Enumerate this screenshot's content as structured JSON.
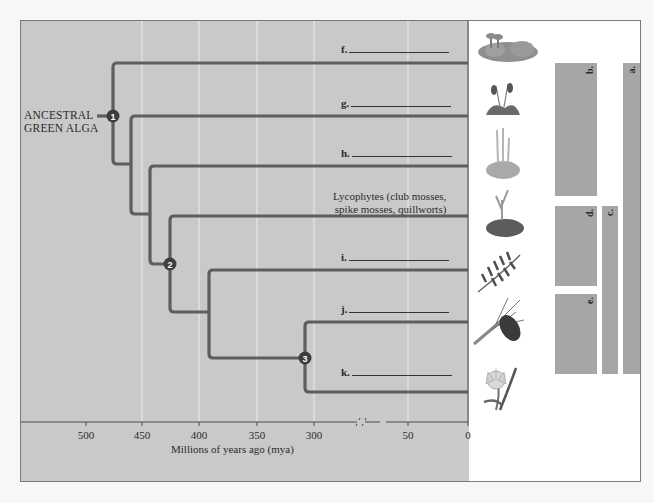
{
  "diagram": {
    "type": "phylogenetic_tree",
    "root_label": [
      "ANCESTRAL",
      "GREEN ALGA"
    ],
    "nodes": [
      {
        "id": "1",
        "label": "1"
      },
      {
        "id": "2",
        "label": "2"
      },
      {
        "id": "3",
        "label": "3"
      }
    ],
    "branches": [
      {
        "label": "f.",
        "blank": true
      },
      {
        "label": "g.",
        "blank": true
      },
      {
        "label": "h.",
        "blank": true
      },
      {
        "label_lines": [
          "Lycophytes (club mosses,",
          "spike mosses, quillworts)"
        ]
      },
      {
        "label": "i.",
        "blank": true
      },
      {
        "label": "j.",
        "blank": true
      },
      {
        "label": "k.",
        "blank": true
      }
    ],
    "axis": {
      "title": "Millions of years ago (mya)",
      "ticks": [
        "500",
        "450",
        "400",
        "350",
        "300",
        "50",
        "0"
      ],
      "break_symbol": "//"
    },
    "plants": [
      {
        "name": "liverwort-illustration"
      },
      {
        "name": "moss-illustration"
      },
      {
        "name": "hornwort-illustration"
      },
      {
        "name": "lycophyte-illustration"
      },
      {
        "name": "fern-illustration"
      },
      {
        "name": "pine-cone-illustration"
      },
      {
        "name": "flower-illustration"
      }
    ],
    "bracket_bars": [
      {
        "label": "a."
      },
      {
        "label": "b."
      },
      {
        "label": "c."
      },
      {
        "label": "d."
      },
      {
        "label": "e."
      }
    ]
  },
  "colors": {
    "panel_bg": "#c9c9c9",
    "branch": "#5e5e5e",
    "node": "#3d3d3d",
    "bar": "#a6a6a6",
    "gridline": "#eeeeee"
  }
}
